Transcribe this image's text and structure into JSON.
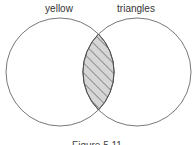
{
  "diagram": {
    "type": "venn",
    "sets": [
      {
        "label": "yellow"
      },
      {
        "label": "triangles"
      }
    ],
    "shaded_region": "intersection",
    "shading_pattern": "diagonal-hatch",
    "caption": "Figure 5.11",
    "colors": {
      "outline": "#555555",
      "hatch_fill": "#d6d6d6",
      "hatch_line": "#444444"
    }
  }
}
